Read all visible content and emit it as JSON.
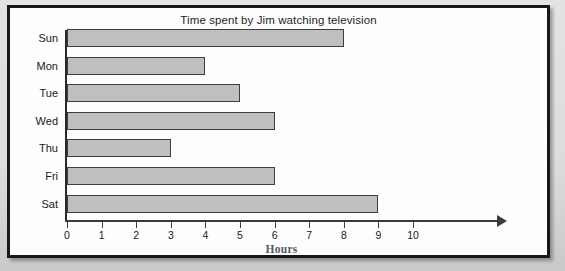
{
  "chart_data": {
    "type": "bar",
    "orientation": "horizontal",
    "title": "Time spent by Jim watching television",
    "xlabel": "Hours",
    "ylabel": "",
    "categories": [
      "Sun",
      "Mon",
      "Tue",
      "Wed",
      "Thu",
      "Fri",
      "Sat"
    ],
    "values": [
      8,
      4,
      5,
      6,
      3,
      6,
      9
    ],
    "xlim": [
      0,
      10
    ],
    "xticks": [
      0,
      1,
      2,
      3,
      4,
      5,
      6,
      7,
      8,
      9,
      10
    ],
    "xtick_labels": [
      "0",
      "1",
      "2",
      "3",
      "4",
      "5",
      "6",
      "7",
      "8",
      "9",
      "10"
    ],
    "grid": false,
    "legend": null,
    "bar_fill_color": "#bfbfbf",
    "bar_edge_color": "#3b3d40",
    "axis_color": "#3a3c3f",
    "frame_color": "#16181a",
    "background_color": "#fdfdfd"
  }
}
